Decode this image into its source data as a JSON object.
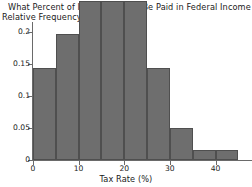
{
  "chart_data": {
    "type": "bar",
    "title": "What Percent of Income Should Be Paid in Federal Income Tax?",
    "ylabel": "Relative Frequency",
    "xlabel": "Tax Rate (%)",
    "categories": [
      "0-5",
      "5-10",
      "10-15",
      "15-20",
      "20-25",
      "25-30",
      "30-35",
      "35-40",
      "40-45"
    ],
    "bin_edges": [
      0,
      5,
      10,
      15,
      20,
      25,
      30,
      35,
      40,
      45
    ],
    "values": [
      0.143,
      0.197,
      0.248,
      0.248,
      0.248,
      0.143,
      0.05,
      0.016,
      0.016
    ],
    "xlim": [
      0,
      48
    ],
    "ylim": [
      0,
      0.215
    ],
    "xticks": [
      0,
      10,
      20,
      30,
      40
    ],
    "xtick_labels": [
      "0",
      "10",
      "20",
      "30",
      "40"
    ],
    "yticks": [
      0,
      0.05,
      0.1,
      0.15,
      0.2
    ],
    "ytick_labels": [
      "0",
      "0.05",
      "0.1",
      "0.15",
      "0.2"
    ],
    "grid": false,
    "legend": null,
    "bar_color": "#6e6e6e",
    "bar_edge_color": "#4f4f4f",
    "axis_color": "#6a6a6a",
    "background_color": "#ffffff"
  }
}
